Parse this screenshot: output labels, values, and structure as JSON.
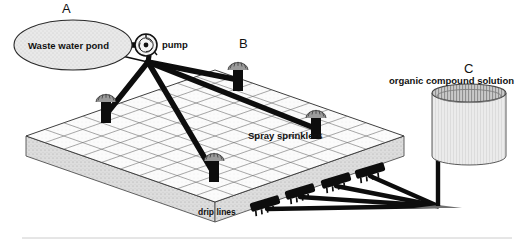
{
  "figure": {
    "background_color": "#ffffff",
    "ink_color": "#111111"
  },
  "callouts": [
    {
      "id": "A",
      "label": "A",
      "x": 62,
      "y": 3
    },
    {
      "id": "B",
      "label": "B",
      "x": 239,
      "y": 38
    },
    {
      "id": "C",
      "label": "C",
      "x": 464,
      "y": 64
    }
  ],
  "components": {
    "pond": {
      "label": "Waste water pond",
      "shape": "ellipse",
      "fill_color": "#e3e3e3",
      "stroke_color": "#2a2a2a",
      "cx": 73,
      "cy": 45,
      "rx": 59,
      "ry": 25
    },
    "pump": {
      "label": "pump",
      "shape": "circle-impeller",
      "fill_color": "#f2f2f2",
      "stroke_color": "#111111",
      "cx": 146,
      "cy": 45,
      "r": 11
    },
    "field": {
      "label": "",
      "description": "gridded field plot slab",
      "top_fill_color": "#fdfdfd",
      "side_fill_color": "#d8d8d8",
      "grid_color": "#6e6e6e",
      "grid_cols": 10,
      "grid_rows": 8,
      "slab_thickness": 20
    },
    "sprinklers": {
      "label": "Spray sprinklers",
      "label_x": 248,
      "label_y": 135,
      "count": 4,
      "color": "#0d0d0d",
      "positions": [
        {
          "x": 106,
          "y": 104
        },
        {
          "x": 238,
          "y": 72
        },
        {
          "x": 214,
          "y": 163
        },
        {
          "x": 316,
          "y": 120
        }
      ]
    },
    "drip_lines": {
      "label": "drip lines",
      "label_x": 198,
      "label_y": 212,
      "count": 4,
      "color": "#0d0d0d",
      "emitter_positions": [
        {
          "x": 272,
          "y": 205
        },
        {
          "x": 305,
          "y": 193
        },
        {
          "x": 341,
          "y": 182
        },
        {
          "x": 375,
          "y": 172
        }
      ],
      "manifold_point": {
        "x": 438,
        "y": 206
      }
    },
    "tank": {
      "label": "organic compound solution",
      "label_x": 389,
      "label_y": 80,
      "shape": "cylinder",
      "fill_color": "#e6e6e6",
      "rim_color": "#8a8a8a",
      "stroke_color": "#5a5a5a",
      "cx": 469,
      "top_y": 93,
      "bottom_y": 156,
      "rx": 37,
      "ry": 9
    },
    "supply_pipe": {
      "color": "#0d0d0d",
      "from": "tank-base",
      "to": "drip-manifold"
    }
  },
  "lines": {
    "pond_to_pump_color": "#0d0d0d",
    "pump_to_sprinkler_color": "#0d0d0d",
    "pump_hub": {
      "x": 148,
      "y": 62
    }
  }
}
